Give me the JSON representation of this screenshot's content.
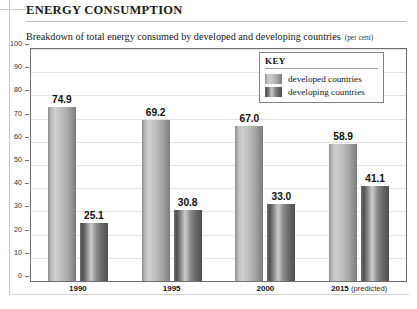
{
  "header": {
    "title": "ENERGY CONSUMPTION",
    "subtitle": "Breakdown of total energy consumed by developed and developing countries",
    "subtitle_unit": "(per cent)"
  },
  "legend": {
    "title": "KEY",
    "items": [
      {
        "label": "developed countries",
        "swatch": "light-gradient-bar-swatch",
        "color": "#bdbdbd"
      },
      {
        "label": "developing countries",
        "swatch": "dark-gradient-bar-swatch",
        "color": "#6b6b6b"
      }
    ]
  },
  "colors": {
    "developed": "#bdbdbd",
    "developing": "#6b6b6b",
    "gridline": "#e2e2e2",
    "axis": "#6e6e6e",
    "text": "#111111"
  },
  "chart_data": {
    "type": "bar",
    "title": "Breakdown of total energy consumed by developed and developing countries (per cent)",
    "xlabel": "",
    "ylabel": "",
    "ylim": [
      0,
      100
    ],
    "yticks": [
      0,
      10,
      20,
      30,
      40,
      50,
      60,
      70,
      80,
      90,
      100
    ],
    "grid": true,
    "legend_position": "inside-top-right",
    "categories": [
      "1990",
      "1995",
      "2000",
      "2015 (predicted)"
    ],
    "category_notes": [
      "",
      "",
      "",
      "(predicted)"
    ],
    "series": [
      {
        "name": "developed countries",
        "values": [
          74.9,
          69.2,
          67.0,
          58.9
        ],
        "labels": [
          "74.9",
          "69.2",
          "67.0",
          "58.9"
        ]
      },
      {
        "name": "developing countries",
        "values": [
          25.1,
          30.8,
          33.0,
          41.1
        ],
        "labels": [
          "25.1",
          "30.8",
          "33.0",
          "41.1"
        ]
      }
    ]
  }
}
